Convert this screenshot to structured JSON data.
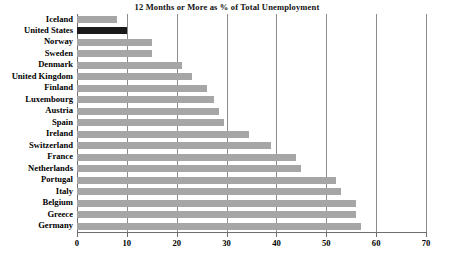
{
  "chart_data": {
    "type": "bar",
    "orientation": "horizontal",
    "title": "12 Months or More as % of Total Unemployment",
    "xlabel": "",
    "ylabel": "",
    "xlim": [
      0,
      70
    ],
    "xticks": [
      0,
      10,
      20,
      30,
      40,
      50,
      60,
      70
    ],
    "grid": true,
    "legend": false,
    "categories": [
      "Iceland",
      "United States",
      "Norway",
      "Sweden",
      "Denmark",
      "United Kingdom",
      "Finland",
      "Luxembourg",
      "Austria",
      "Spain",
      "Ireland",
      "Switzerland",
      "France",
      "Netherlands",
      "Portugal",
      "Italy",
      "Belgium",
      "Greece",
      "Germany"
    ],
    "values": [
      8,
      10,
      15,
      15,
      21,
      23,
      26,
      27.5,
      28.5,
      29.5,
      34.5,
      39,
      44,
      45,
      52,
      53,
      56,
      56,
      57
    ],
    "highlight_category": "United States",
    "colors": {
      "bar": "#a6a6a6",
      "highlight_bar": "#1a1a1a",
      "grid": "#8c8c8c",
      "axis": "#6e6e6e",
      "text": "#000000",
      "background": "#ffffff"
    }
  }
}
